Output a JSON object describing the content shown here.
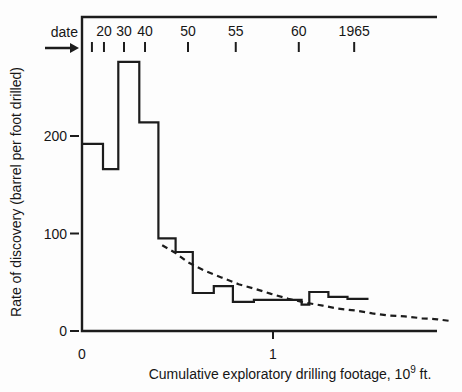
{
  "figure": {
    "background_color": "#fdfdfd",
    "text_color": "#161616"
  },
  "chart_data": {
    "type": "line",
    "subtype": "step-histogram-with-fitted-decline-curve",
    "title": "",
    "xlabel": "Cumulative exploratory drilling footage, 10^9 ft.",
    "xlabel_parts": {
      "prefix": "Cumulative exploratory drilling footage, 10",
      "sup": "9",
      "suffix": " ft."
    },
    "ylabel": "Rate of discovery (barrel per foot drilled)",
    "xlim": [
      0,
      1.86
    ],
    "ylim": [
      0,
      322
    ],
    "grid": false,
    "legend": "none",
    "line_color": "#1c1c1c",
    "x_ticks": [
      {
        "value": 0,
        "label": "0",
        "mark": false
      },
      {
        "value": 1,
        "label": "1",
        "mark": true
      }
    ],
    "y_ticks": [
      {
        "value": 0,
        "label": "0"
      },
      {
        "value": 100,
        "label": "100"
      },
      {
        "value": 200,
        "label": "200"
      }
    ],
    "date_axis": {
      "label": "date",
      "ticks": [
        {
          "x": 0.052,
          "label": ""
        },
        {
          "x": 0.115,
          "label": "20"
        },
        {
          "x": 0.22,
          "label": "30"
        },
        {
          "x": 0.33,
          "label": "40"
        },
        {
          "x": 0.555,
          "label": "50"
        },
        {
          "x": 0.805,
          "label": "55"
        },
        {
          "x": 1.135,
          "label": "60"
        },
        {
          "x": 1.425,
          "label": "1965"
        }
      ]
    },
    "series": [
      {
        "name": "observed discovery rate (step)",
        "style": "solid-step",
        "x_edges": [
          0,
          0.11,
          0.19,
          0.3,
          0.4,
          0.49,
          0.58,
          0.69,
          0.79,
          0.9,
          1.15,
          1.19,
          1.29,
          1.39,
          1.5
        ],
        "values": [
          192,
          166,
          276,
          214,
          95,
          81,
          39,
          46,
          30,
          32,
          27,
          40,
          35,
          33
        ]
      },
      {
        "name": "fitted exponential decline",
        "style": "dashed",
        "points": [
          [
            0.42,
            88
          ],
          [
            0.49,
            80
          ],
          [
            0.55,
            71
          ],
          [
            0.64,
            62
          ],
          [
            0.73,
            55
          ],
          [
            0.82,
            48
          ],
          [
            0.91,
            43
          ],
          [
            0.99,
            38
          ],
          [
            1.08,
            33
          ],
          [
            1.17,
            29
          ],
          [
            1.26,
            26
          ],
          [
            1.34,
            23
          ],
          [
            1.43,
            21
          ],
          [
            1.52,
            18
          ],
          [
            1.6,
            16
          ],
          [
            1.69,
            15
          ],
          [
            1.78,
            13
          ],
          [
            1.86,
            12
          ],
          [
            1.94,
            10
          ]
        ]
      }
    ]
  }
}
